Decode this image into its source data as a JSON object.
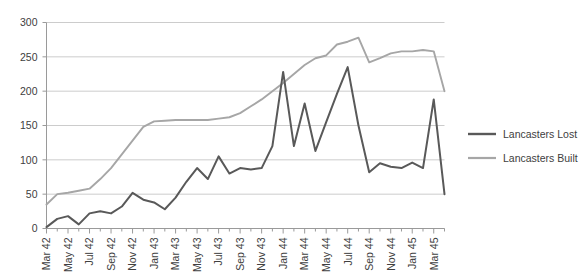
{
  "chart_data": {
    "type": "line",
    "title": "",
    "xlabel": "",
    "ylabel": "",
    "ylim": [
      0,
      300
    ],
    "ytick_labels": [
      "0",
      "50",
      "100",
      "150",
      "200",
      "250",
      "300"
    ],
    "ytick_values": [
      0,
      50,
      100,
      150,
      200,
      250,
      300
    ],
    "grid": true,
    "legend_position": "right",
    "x": [
      "Mar 42",
      "Apr 42",
      "May 42",
      "Jun 42",
      "Jul 42",
      "Aug 42",
      "Sep 42",
      "Oct 42",
      "Nov 42",
      "Dec 42",
      "Jan 43",
      "Feb 43",
      "Mar 43",
      "Apr 43",
      "May 43",
      "Jun 43",
      "Jul 43",
      "Aug 43",
      "Sep 43",
      "Oct 43",
      "Nov 43",
      "Dec 43",
      "Jan 44",
      "Feb 44",
      "Mar 44",
      "Apr 44",
      "May 44",
      "Jun 44",
      "Jul 44",
      "Aug 44",
      "Sep 44",
      "Oct 44",
      "Nov 44",
      "Dec 44",
      "Jan 45",
      "Feb 45",
      "Mar 45",
      "Apr 45"
    ],
    "xtick_labels": [
      "Mar 42",
      "May 42",
      "Jul 42",
      "Sep 42",
      "Nov 42",
      "Jan 43",
      "Mar 43",
      "May 43",
      "Jul 43",
      "Sep 43",
      "Nov 43",
      "Jan 44",
      "Mar 44",
      "May 44",
      "Jul 44",
      "Sep 44",
      "Nov 44",
      "Jan 45",
      "Mar 45"
    ],
    "series": [
      {
        "name": "Lancasters Lost",
        "color": "#595959",
        "values": [
          2,
          14,
          18,
          6,
          22,
          25,
          22,
          32,
          52,
          42,
          38,
          28,
          45,
          68,
          88,
          72,
          105,
          80,
          88,
          86,
          88,
          120,
          228,
          120,
          182,
          113,
          155,
          196,
          235,
          150,
          82,
          95,
          90,
          88,
          96,
          88,
          188,
          50
        ]
      },
      {
        "name": "Lancasters Built",
        "color": "#A6A6A6",
        "values": [
          35,
          50,
          52,
          55,
          58,
          72,
          88,
          108,
          128,
          148,
          156,
          157,
          158,
          158,
          158,
          158,
          160,
          162,
          168,
          178,
          188,
          200,
          212,
          225,
          238,
          248,
          252,
          268,
          272,
          278,
          242,
          248,
          255,
          258,
          258,
          260,
          258,
          200
        ]
      }
    ]
  },
  "legend": {
    "items": [
      {
        "label": "Lancasters Lost",
        "color": "#595959"
      },
      {
        "label": "Lancasters Built",
        "color": "#A6A6A6"
      }
    ]
  }
}
